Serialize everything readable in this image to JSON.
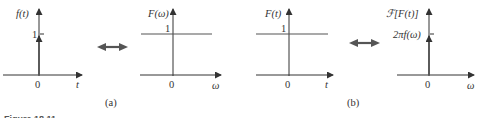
{
  "figure": {
    "caption_partial": "Figure 18.11",
    "colors": {
      "axis": "#333333",
      "signal": "#555555",
      "text": "#333333"
    }
  },
  "panel_a": {
    "label": "(a)",
    "left_plot": {
      "ylabel": "f(t)",
      "xlabel": "t",
      "origin_label": "0",
      "tick_label": "1",
      "signal": "impulse at t=0, height 1"
    },
    "right_plot": {
      "ylabel": "F(ω)",
      "xlabel": "ω",
      "origin_label": "0",
      "level_label": "1",
      "signal": "constant 1 for all ω"
    },
    "arrow": "double-headed arrow (transform pair)"
  },
  "panel_b": {
    "label": "(b)",
    "left_plot": {
      "ylabel": "F(t)",
      "xlabel": "t",
      "origin_label": "0",
      "level_label": "1",
      "signal": "constant 1 for all t"
    },
    "right_plot": {
      "ylabel": "ℱ[F(t)]",
      "xlabel": "ω",
      "origin_label": "0",
      "tick_label": "2πf(ω)",
      "signal": "impulse at ω=0, height 2πf(ω)"
    },
    "arrow": "double-headed arrow (transform pair)"
  }
}
